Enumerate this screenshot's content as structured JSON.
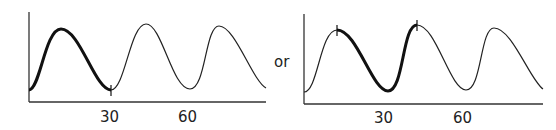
{
  "panels": [
    {
      "id": "left",
      "tick_labels": [
        "30",
        "60"
      ],
      "highlight": "first peak through first trough (0 to 30)"
    },
    {
      "id": "right",
      "tick_labels": [
        "30",
        "60"
      ],
      "highlight": "first peak to second peak"
    }
  ],
  "connector_text": "or",
  "colors": {
    "line": "#222222",
    "axis": "#333333"
  }
}
